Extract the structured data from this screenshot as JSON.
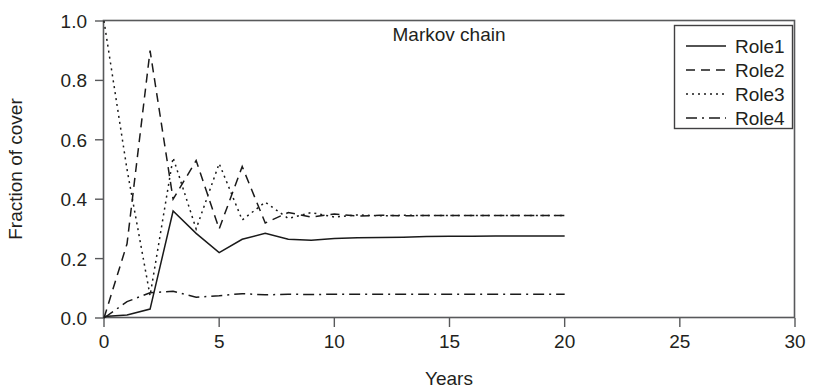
{
  "chart_data": {
    "type": "line",
    "title": "Markov chain",
    "xlabel": "Years",
    "ylabel": "Fraction of cover",
    "xlim": [
      0,
      30
    ],
    "ylim": [
      0.0,
      1.0
    ],
    "xticks": [
      0,
      5,
      10,
      15,
      20,
      25,
      30
    ],
    "xtick_labels": [
      "0",
      "5",
      "10",
      "15",
      "20",
      "25",
      "30"
    ],
    "yticks": [
      0.0,
      0.2,
      0.4,
      0.6,
      0.8,
      1.0
    ],
    "ytick_labels": [
      "0.0",
      "0.2",
      "0.4",
      "0.6",
      "0.8",
      "1.0"
    ],
    "grid": false,
    "legend_position": "top-right",
    "x": [
      0,
      1,
      2,
      3,
      4,
      5,
      6,
      7,
      8,
      9,
      10,
      11,
      12,
      13,
      14,
      15,
      16,
      17,
      18,
      19,
      20
    ],
    "series": [
      {
        "name": "Role1",
        "style": "solid",
        "dash": "none",
        "color": "#1a1a1a",
        "values": [
          0.005,
          0.01,
          0.03,
          0.36,
          0.285,
          0.22,
          0.265,
          0.285,
          0.265,
          0.262,
          0.268,
          0.27,
          0.271,
          0.272,
          0.274,
          0.275,
          0.275,
          0.276,
          0.276,
          0.276,
          0.276
        ]
      },
      {
        "name": "Role2",
        "style": "dashed",
        "dash": "9,6",
        "color": "#1a1a1a",
        "values": [
          0.0,
          0.25,
          0.9,
          0.4,
          0.53,
          0.3,
          0.51,
          0.32,
          0.355,
          0.34,
          0.35,
          0.343,
          0.346,
          0.344,
          0.345,
          0.345,
          0.345,
          0.345,
          0.345,
          0.345,
          0.345
        ]
      },
      {
        "name": "Role3",
        "style": "dotted",
        "dash": "2,4",
        "color": "#1a1a1a",
        "values": [
          1.0,
          0.5,
          0.075,
          0.54,
          0.3,
          0.52,
          0.33,
          0.39,
          0.335,
          0.355,
          0.34,
          0.347,
          0.344,
          0.346,
          0.345,
          0.345,
          0.345,
          0.345,
          0.345,
          0.345,
          0.345
        ]
      },
      {
        "name": "Role4",
        "style": "dashdot",
        "dash": "11,5,2,5",
        "color": "#1a1a1a",
        "values": [
          0.0,
          0.055,
          0.085,
          0.09,
          0.07,
          0.075,
          0.082,
          0.078,
          0.08,
          0.079,
          0.08,
          0.08,
          0.08,
          0.08,
          0.08,
          0.08,
          0.08,
          0.08,
          0.08,
          0.08,
          0.08
        ]
      }
    ]
  },
  "legend": {
    "items": [
      {
        "label": "Role1"
      },
      {
        "label": "Role2"
      },
      {
        "label": "Role3"
      },
      {
        "label": "Role4"
      }
    ]
  },
  "colors": {
    "ink": "#231f20",
    "frame": "#58595b",
    "series": "#1a1a1a",
    "background": "#ffffff"
  }
}
